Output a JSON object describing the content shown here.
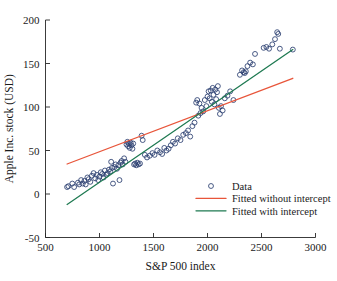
{
  "chart_data": {
    "type": "scatter",
    "title": "",
    "xlabel": "S&P 500 index",
    "ylabel": "Apple Inc. stock (USD)",
    "xlim": [
      500,
      3000
    ],
    "ylim": [
      -50,
      200
    ],
    "xticks": [
      500,
      1000,
      1500,
      2000,
      2500,
      3000
    ],
    "yticks": [
      -50,
      0,
      50,
      100,
      150,
      200
    ],
    "xticklabels": [
      "500",
      "1000",
      "1500",
      "2000",
      "2500",
      "3000"
    ],
    "yticklabels": [
      "-50",
      "0",
      "50",
      "100",
      "150",
      "200"
    ],
    "grid": false,
    "legend_position": "lower right",
    "marker_color": "#2b3f70",
    "marker_style": "open-circle",
    "series": [
      {
        "name": "Data",
        "type": "scatter",
        "marker": "o",
        "color": "#2b3f70",
        "points": [
          [
            700,
            8
          ],
          [
            712,
            9
          ],
          [
            748,
            12
          ],
          [
            765,
            8
          ],
          [
            800,
            13
          ],
          [
            812,
            11
          ],
          [
            830,
            16
          ],
          [
            845,
            12
          ],
          [
            860,
            15
          ],
          [
            872,
            11
          ],
          [
            888,
            19
          ],
          [
            900,
            17
          ],
          [
            915,
            14
          ],
          [
            930,
            21
          ],
          [
            945,
            24
          ],
          [
            960,
            18
          ],
          [
            975,
            22
          ],
          [
            988,
            16
          ],
          [
            1000,
            20
          ],
          [
            1012,
            25
          ],
          [
            1025,
            23
          ],
          [
            1038,
            19
          ],
          [
            1050,
            27
          ],
          [
            1062,
            22
          ],
          [
            1075,
            24
          ],
          [
            1088,
            28
          ],
          [
            1100,
            26
          ],
          [
            1108,
            37
          ],
          [
            1115,
            30
          ],
          [
            1125,
            12
          ],
          [
            1138,
            31
          ],
          [
            1150,
            34
          ],
          [
            1162,
            29
          ],
          [
            1175,
            33
          ],
          [
            1185,
            16
          ],
          [
            1195,
            36
          ],
          [
            1205,
            38
          ],
          [
            1215,
            34
          ],
          [
            1228,
            41
          ],
          [
            1240,
            37
          ],
          [
            1250,
            57
          ],
          [
            1258,
            60
          ],
          [
            1265,
            55
          ],
          [
            1272,
            58
          ],
          [
            1280,
            53
          ],
          [
            1288,
            59
          ],
          [
            1296,
            56
          ],
          [
            1305,
            52
          ],
          [
            1312,
            58
          ],
          [
            1320,
            34
          ],
          [
            1330,
            35
          ],
          [
            1340,
            33
          ],
          [
            1350,
            36
          ],
          [
            1362,
            34
          ],
          [
            1375,
            35
          ],
          [
            1390,
            67
          ],
          [
            1400,
            62
          ],
          [
            1420,
            45
          ],
          [
            1440,
            42
          ],
          [
            1465,
            44
          ],
          [
            1490,
            47
          ],
          [
            1510,
            45
          ],
          [
            1535,
            50
          ],
          [
            1560,
            48
          ],
          [
            1580,
            46
          ],
          [
            1600,
            53
          ],
          [
            1620,
            50
          ],
          [
            1640,
            52
          ],
          [
            1660,
            56
          ],
          [
            1680,
            60
          ],
          [
            1700,
            58
          ],
          [
            1725,
            64
          ],
          [
            1750,
            62
          ],
          [
            1775,
            68
          ],
          [
            1800,
            70
          ],
          [
            1820,
            73
          ],
          [
            1840,
            66
          ],
          [
            1860,
            78
          ],
          [
            1880,
            82
          ],
          [
            1895,
            105
          ],
          [
            1905,
            108
          ],
          [
            1915,
            90
          ],
          [
            1925,
            104
          ],
          [
            1935,
            93
          ],
          [
            1945,
            99
          ],
          [
            1960,
            95
          ],
          [
            1975,
            108
          ],
          [
            1990,
            101
          ],
          [
            2000,
            112
          ],
          [
            2010,
            118
          ],
          [
            2020,
            110
          ],
          [
            2030,
            119
          ],
          [
            2040,
            106
          ],
          [
            2048,
            122
          ],
          [
            2056,
            114
          ],
          [
            2064,
            103
          ],
          [
            2072,
            120
          ],
          [
            2080,
            109
          ],
          [
            2088,
            117
          ],
          [
            2096,
            124
          ],
          [
            2105,
            99
          ],
          [
            2115,
            92
          ],
          [
            2125,
            101
          ],
          [
            2140,
            96
          ],
          [
            2160,
            110
          ],
          [
            2185,
            113
          ],
          [
            2210,
            118
          ],
          [
            2240,
            108
          ],
          [
            2300,
            137
          ],
          [
            2320,
            142
          ],
          [
            2335,
            140
          ],
          [
            2345,
            139
          ],
          [
            2355,
            141
          ],
          [
            2370,
            147
          ],
          [
            2395,
            151
          ],
          [
            2420,
            149
          ],
          [
            2440,
            161
          ],
          [
            2520,
            168
          ],
          [
            2545,
            169
          ],
          [
            2570,
            167
          ],
          [
            2600,
            172
          ],
          [
            2625,
            178
          ],
          [
            2645,
            186
          ],
          [
            2655,
            184
          ],
          [
            2670,
            167
          ],
          [
            2790,
            166
          ]
        ]
      },
      {
        "name": "Fitted without intercept",
        "type": "line",
        "color": "#e8553a",
        "slope": 0.0471,
        "intercept": 0,
        "endpoints": [
          [
            700,
            34.5
          ],
          [
            2790,
            133.0
          ]
        ]
      },
      {
        "name": "Fitted with intercept",
        "type": "line",
        "color": "#1f7a52",
        "slope": 0.0853,
        "intercept": -71.6,
        "endpoints": [
          [
            700,
            -12.0
          ],
          [
            2790,
            166.0
          ]
        ]
      }
    ],
    "legend": [
      {
        "label": "Data",
        "marker": "open-circle",
        "color": "#2b3f70"
      },
      {
        "label": "Fitted without intercept",
        "marker": "line",
        "color": "#e8553a"
      },
      {
        "label": "Fitted with intercept",
        "marker": "line",
        "color": "#1f7a52"
      }
    ]
  }
}
